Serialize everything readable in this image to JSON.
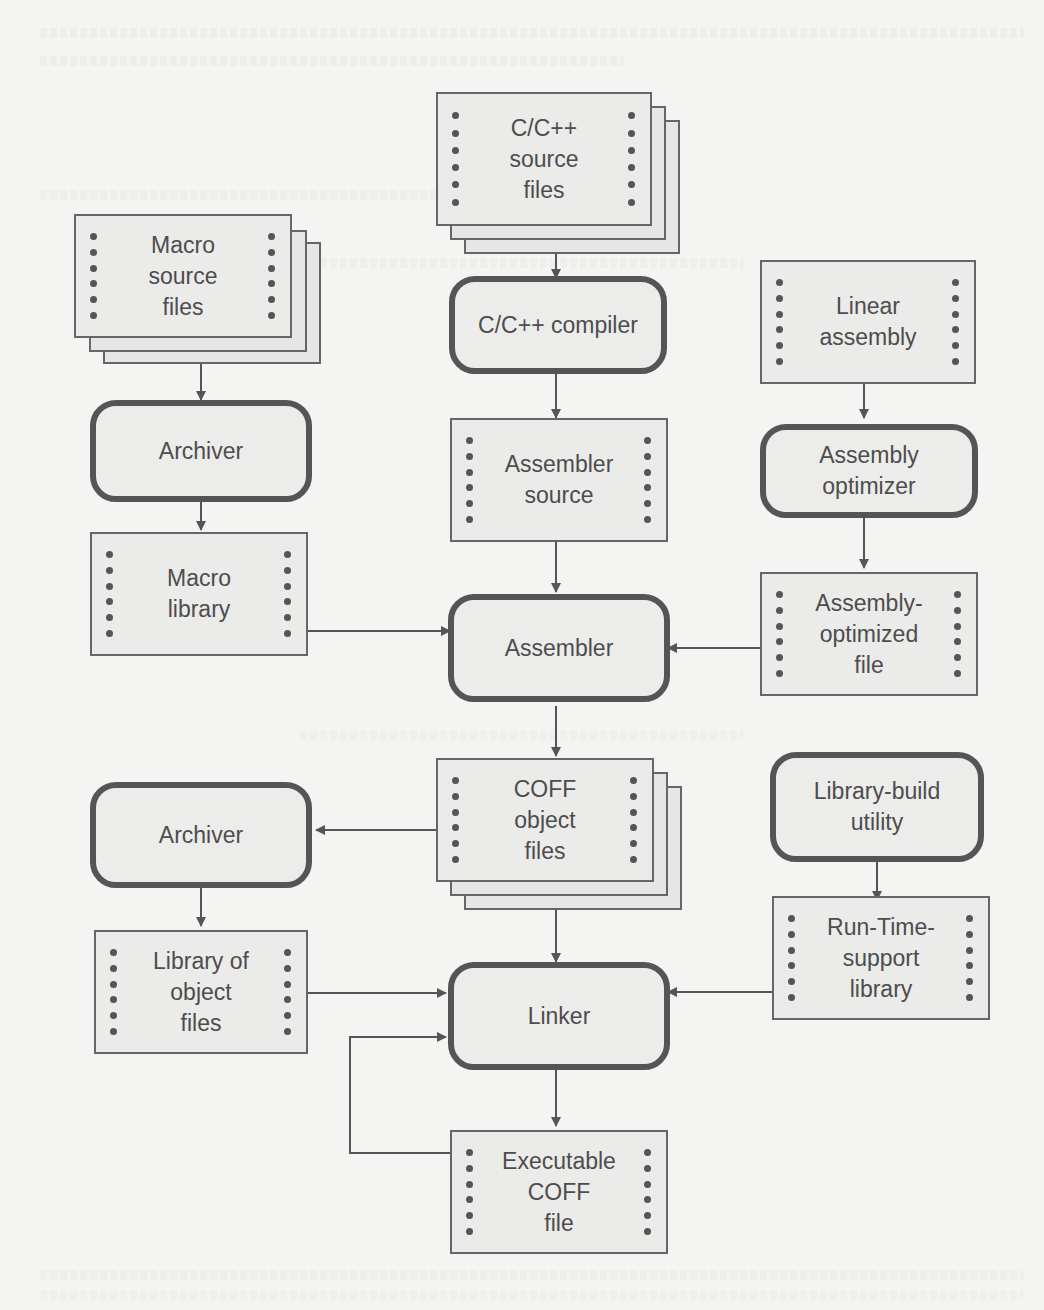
{
  "diagram": {
    "title": "",
    "colors": {
      "background": "#f4f4f2",
      "box_fill": "#ebebea",
      "stroke": "#555555",
      "text": "#4d4d4d"
    },
    "nodes": {
      "cpp_source": {
        "label": "C/C++\nsource\nfiles",
        "type": "file-stack"
      },
      "macro_source": {
        "label": "Macro\nsource\nfiles",
        "type": "file-stack"
      },
      "cpp_compiler": {
        "label": "C/C++ compiler",
        "type": "process"
      },
      "linear_assembly": {
        "label": "Linear\nassembly",
        "type": "file"
      },
      "archiver_top": {
        "label": "Archiver",
        "type": "process"
      },
      "assembler_source": {
        "label": "Assembler\nsource",
        "type": "file"
      },
      "assembly_optimizer": {
        "label": "Assembly\noptimizer",
        "type": "process"
      },
      "macro_library": {
        "label": "Macro\nlibrary",
        "type": "file"
      },
      "assembly_optimized_file": {
        "label": "Assembly-\noptimized\nfile",
        "type": "file"
      },
      "assembler": {
        "label": "Assembler",
        "type": "process"
      },
      "coff_object_files": {
        "label": "COFF\nobject\nfiles",
        "type": "file-stack"
      },
      "archiver_bottom": {
        "label": "Archiver",
        "type": "process"
      },
      "library_build_utility": {
        "label": "Library-build\nutility",
        "type": "process"
      },
      "library_of_object_files": {
        "label": "Library of\nobject\nfiles",
        "type": "file"
      },
      "runtime_support_library": {
        "label": "Run-Time-\nsupport\nlibrary",
        "type": "file"
      },
      "linker": {
        "label": "Linker",
        "type": "process"
      },
      "executable_coff_file": {
        "label": "Executable\nCOFF\nfile",
        "type": "file"
      }
    },
    "edges": [
      [
        "cpp_source",
        "cpp_compiler"
      ],
      [
        "cpp_compiler",
        "assembler_source"
      ],
      [
        "assembler_source",
        "assembler"
      ],
      [
        "macro_source",
        "archiver_top"
      ],
      [
        "archiver_top",
        "macro_library"
      ],
      [
        "macro_library",
        "assembler"
      ],
      [
        "linear_assembly",
        "assembly_optimizer"
      ],
      [
        "assembly_optimizer",
        "assembly_optimized_file"
      ],
      [
        "assembly_optimized_file",
        "assembler"
      ],
      [
        "assembler",
        "coff_object_files"
      ],
      [
        "coff_object_files",
        "archiver_bottom"
      ],
      [
        "archiver_bottom",
        "library_of_object_files"
      ],
      [
        "coff_object_files",
        "linker"
      ],
      [
        "library_of_object_files",
        "linker"
      ],
      [
        "library_build_utility",
        "runtime_support_library"
      ],
      [
        "runtime_support_library",
        "linker"
      ],
      [
        "linker",
        "executable_coff_file"
      ],
      [
        "executable_coff_file",
        "linker"
      ]
    ]
  }
}
